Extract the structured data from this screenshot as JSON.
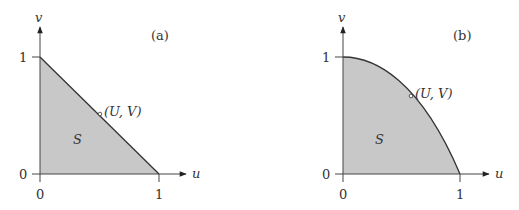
{
  "panels": [
    {
      "id": "a",
      "tag": "(a)",
      "region_label": "S",
      "point_label": "(U, V)",
      "x_axis_label": "u",
      "y_axis_label": "v",
      "x_ticks": [
        "0",
        "1"
      ],
      "y_ticks": [
        "0",
        "1"
      ],
      "boundary": "line"
    },
    {
      "id": "b",
      "tag": "(b)",
      "region_label": "S",
      "point_label": "(U, V)",
      "x_axis_label": "u",
      "y_axis_label": "v",
      "x_ticks": [
        "0",
        "1"
      ],
      "y_ticks": [
        "0",
        "1"
      ],
      "boundary": "curve"
    }
  ],
  "colors": {
    "fill": "#c8c8c8",
    "stroke": "#333333"
  }
}
